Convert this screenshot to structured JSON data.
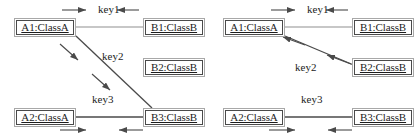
{
  "figure": {
    "type": "uml-object-collaboration-diagram-pair",
    "background_color": "#ffffff",
    "line_color": "#4a4a4a",
    "box_border_outer_color": "#a8a8a8",
    "box_border_inner_color": "#4a4a4a",
    "text_color": "#1c1c1c"
  },
  "diagrams": [
    {
      "id": "left",
      "name": "left-diagram",
      "objects": [
        {
          "id": "a1",
          "label": "A1:ClassA",
          "x": 14,
          "y": 18,
          "w": 62,
          "h": 19
        },
        {
          "id": "b1",
          "label": "B1:ClassB",
          "x": 143,
          "y": 18,
          "w": 62,
          "h": 19
        },
        {
          "id": "b2",
          "label": "B2:ClassB",
          "x": 143,
          "y": 58,
          "w": 62,
          "h": 19
        },
        {
          "id": "a2",
          "label": "A2:ClassA",
          "x": 14,
          "y": 108,
          "w": 62,
          "h": 19
        },
        {
          "id": "b3",
          "label": "B3:ClassB",
          "x": 143,
          "y": 108,
          "w": 62,
          "h": 19
        }
      ],
      "links": [
        {
          "id": "key1",
          "label": "key1",
          "from": "a1",
          "to": "b1",
          "label_x": 98,
          "label_y": 6
        },
        {
          "id": "key2",
          "label": "key2",
          "from": "a1",
          "to": "b3",
          "label_x": 102,
          "label_y": 53
        },
        {
          "id": "key3",
          "label": "key3",
          "from": "a2",
          "to": "b3",
          "label_x": 92,
          "label_y": 96
        }
      ]
    },
    {
      "id": "right",
      "name": "right-diagram",
      "objects": [
        {
          "id": "a1",
          "label": "A1:ClassA",
          "x": 14,
          "y": 18,
          "w": 62,
          "h": 19
        },
        {
          "id": "b1",
          "label": "B1:ClassB",
          "x": 143,
          "y": 18,
          "w": 62,
          "h": 19
        },
        {
          "id": "b2",
          "label": "B2:ClassB",
          "x": 143,
          "y": 58,
          "w": 62,
          "h": 19
        },
        {
          "id": "a2",
          "label": "A2:ClassA",
          "x": 14,
          "y": 108,
          "w": 62,
          "h": 19
        },
        {
          "id": "b3",
          "label": "B3:ClassB",
          "x": 143,
          "y": 108,
          "w": 62,
          "h": 19
        }
      ],
      "links": [
        {
          "id": "key1",
          "label": "key1",
          "from": "a1",
          "to": "b1",
          "label_x": 98,
          "label_y": 6
        },
        {
          "id": "key2",
          "label": "key2",
          "from": "a1",
          "to": "b2",
          "label_x": 86,
          "label_y": 64
        },
        {
          "id": "key3",
          "label": "key3",
          "from": "a2",
          "to": "b3",
          "label_x": 92,
          "label_y": 96
        }
      ]
    }
  ],
  "labels": {
    "key1": "key1",
    "key2": "key2",
    "key3": "key3",
    "a1": "A1:ClassA",
    "a2": "A2:ClassA",
    "b1": "B1:ClassB",
    "b2": "B2:ClassB",
    "b3": "B3:ClassB"
  }
}
